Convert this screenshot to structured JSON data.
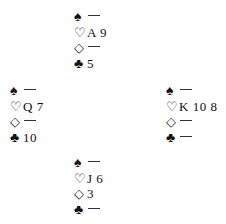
{
  "diagram": {
    "type": "bridge-deal",
    "void_symbol": "—",
    "suit_symbols": {
      "spades": "♠",
      "hearts": "♡",
      "diamonds": "◇",
      "clubs": "♣"
    },
    "hands": {
      "north": {
        "spades": "",
        "hearts": "A 9",
        "diamonds": "",
        "clubs": "5"
      },
      "west": {
        "spades": "",
        "hearts": "Q 7",
        "diamonds": "",
        "clubs": "10"
      },
      "east": {
        "spades": "",
        "hearts": "K 10 8",
        "diamonds": "",
        "clubs": ""
      },
      "south": {
        "spades": "",
        "hearts": "J 6",
        "diamonds": "3",
        "clubs": ""
      }
    }
  }
}
